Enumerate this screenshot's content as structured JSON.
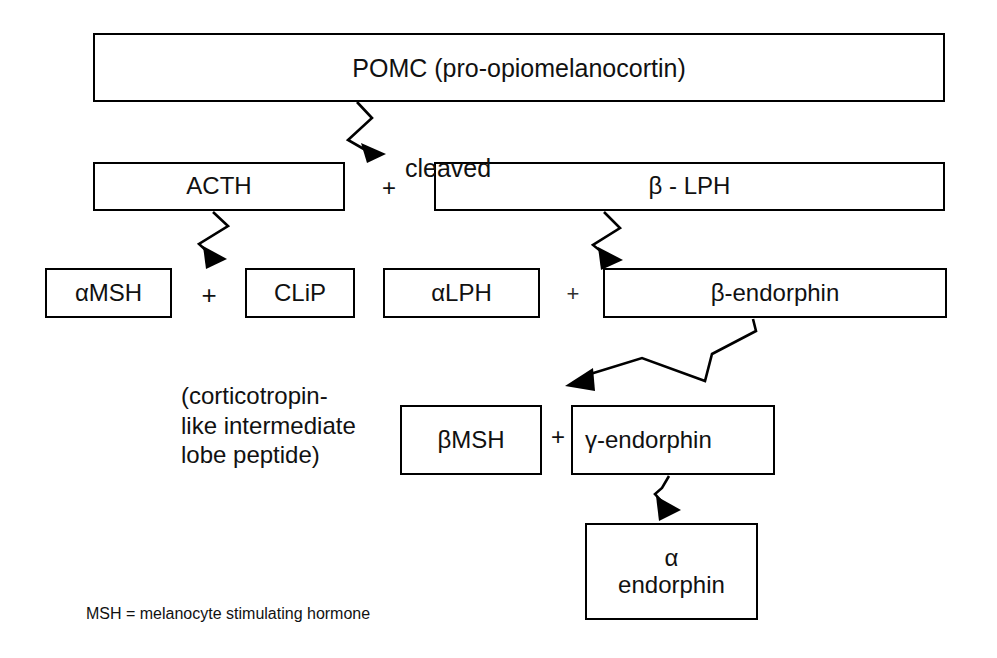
{
  "diagram": {
    "title_text": "POMC (pro-opiomelanocortin)",
    "nodes": {
      "pomc": {
        "label": "POMC (pro-opiomelanocortin)"
      },
      "acth": {
        "label": "ACTH"
      },
      "beta_lph": {
        "label": "β - LPH"
      },
      "alpha_msh": {
        "label": "αMSH"
      },
      "clip": {
        "label": "CLiP"
      },
      "alpha_lph": {
        "label": "αLPH"
      },
      "beta_endo": {
        "label": "β-endorphin"
      },
      "beta_msh": {
        "label": "βMSH"
      },
      "gamma_endo": {
        "label": "γ-endorphin"
      },
      "alpha_endo": {
        "label": "α\nendorphin"
      }
    },
    "operators": {
      "plus_acth_lph": "+",
      "plus_msh_clip": "+",
      "plus_lph_endo": "+",
      "plus_bmsh_gendo": "+"
    },
    "annotations": {
      "cleaved": "cleaved",
      "clip_expansion": "(corticotropin-\nlike intermediate\nlobe peptide)",
      "msh_legend": "MSH = melanocyte stimulating hormone"
    },
    "colors": {
      "background": "#ffffff",
      "stroke": "#000000",
      "text": "#111111"
    }
  }
}
